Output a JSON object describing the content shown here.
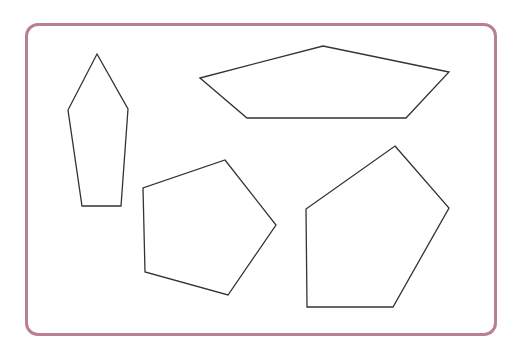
{
  "frame": {
    "border_color": "#b9808f"
  },
  "shapes": [
    {
      "name": "tall-pentagon",
      "points": "97,54 128,109 121,206 82,206 68,110"
    },
    {
      "name": "wide-pentagon",
      "points": "200,78 323,46 449,72 406,118 247,118"
    },
    {
      "name": "regular-pentagon",
      "points": "225,160 276,225 228,295 145,272 143,188"
    },
    {
      "name": "irregular-pentagon",
      "points": "395,146 449,208 393,307 307,307 306,209"
    }
  ],
  "stroke_color": "#333333"
}
